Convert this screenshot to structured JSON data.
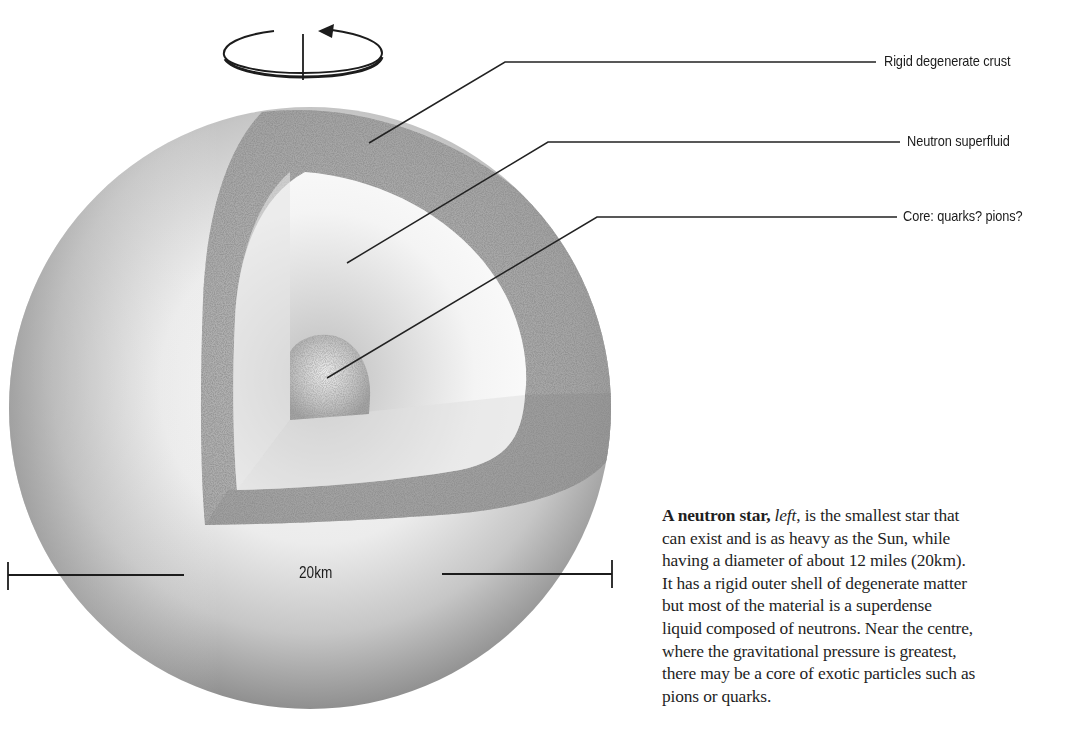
{
  "figure": {
    "rotation_icon": "rotation-arrow-icon",
    "labels": [
      {
        "id": "crust",
        "text": "Rigid degenerate crust"
      },
      {
        "id": "superfluid",
        "text": "Neutron superfluid"
      },
      {
        "id": "core",
        "text": "Core: quarks? pions?"
      }
    ],
    "scale_bar": {
      "label": "20km"
    },
    "colors": {
      "background": "#ffffff",
      "sphere_light": "#f4f4f4",
      "sphere_dark": "#8e8e8e",
      "crust": "#a6a6a6",
      "superfluid": "#f2f2f2",
      "line": "#1c1c1c"
    }
  },
  "caption": {
    "bold_lead": "A neutron star,",
    "italic_word": "left",
    "rest_line1": ", is the smallest star that",
    "lines": [
      "can exist and is as heavy as the Sun, while",
      "having a diameter of about 12 miles (20km).",
      "It has a rigid outer shell of degenerate matter",
      "but most of the material is a superdense",
      "liquid composed of neutrons. Near the centre,",
      "where the gravitational pressure is greatest,",
      "there may be a core of exotic particles such as",
      "pions or quarks."
    ]
  }
}
